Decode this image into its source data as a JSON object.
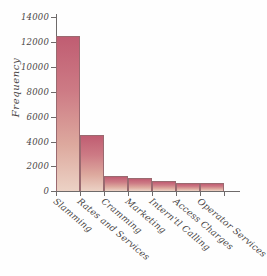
{
  "chart_data": {
    "type": "bar",
    "title": "",
    "subtitle": "",
    "xlabel": "",
    "ylabel": "Frequency",
    "categories": [
      "Slamming",
      "Rates and Services",
      "Cramming",
      "Marketing",
      "Intern'tl Calling",
      "Access Charges",
      "Operator Services"
    ],
    "values": [
      12500,
      4500,
      1200,
      1050,
      800,
      680,
      620
    ],
    "ylim": [
      0,
      14000
    ],
    "yticks": [
      0,
      2000,
      4000,
      6000,
      8000,
      10000,
      12000,
      14000
    ],
    "ytick_labels": [
      "0",
      "2000",
      "4000",
      "6000",
      "8000",
      "10000",
      "12000",
      "14000"
    ],
    "grid": false,
    "legend": false,
    "legend_position": "none",
    "bar_color_top": "#c05d72",
    "bar_color_bottom": "#ecd2c5",
    "bar_edge_color": "#9a6a70",
    "axis_color": "#6e6a6a",
    "text_color": "#4a4646",
    "background_color": "#fefefe"
  }
}
